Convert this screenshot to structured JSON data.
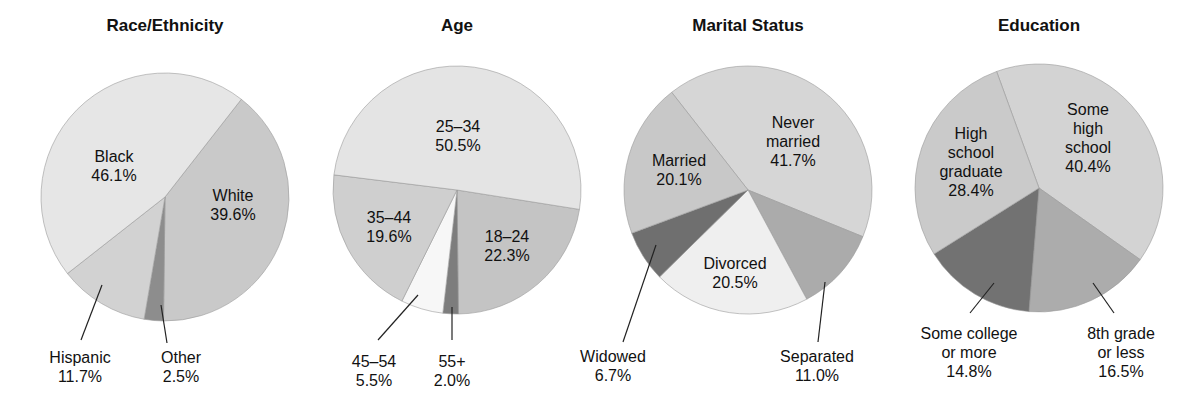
{
  "chart_data": [
    {
      "type": "pie",
      "title": "Race/Ethnicity",
      "center": [
        165,
        197
      ],
      "radius": 124,
      "start_angle": 38,
      "slices": [
        {
          "label": "White",
          "value": 39.6,
          "display": "39.6%",
          "color": "#c9c9c9",
          "label_pos": [
            233,
            186
          ],
          "inside": true
        },
        {
          "label": "Other",
          "value": 2.5,
          "display": "2.5%",
          "color": "#8d8d8d",
          "label_pos": [
            181,
            348
          ],
          "inside": false,
          "leader": [
            [
              161,
              305
            ],
            [
              167,
              343
            ]
          ]
        },
        {
          "label": "Hispanic",
          "value": 11.7,
          "display": "11.7%",
          "color": "#d2d2d2",
          "label_pos": [
            80,
            348
          ],
          "inside": false,
          "leader": [
            [
              102,
              285
            ],
            [
              81,
              340
            ]
          ]
        },
        {
          "label": "Black",
          "value": 46.1,
          "display": "46.1%",
          "color": "#e6e6e6",
          "label_pos": [
            114,
            147
          ],
          "inside": true
        }
      ]
    },
    {
      "type": "pie",
      "title": "Age",
      "center": [
        457,
        190
      ],
      "radius": 124,
      "start_angle": 99,
      "slices": [
        {
          "label": "18–24",
          "value": 22.3,
          "display": "22.3%",
          "color": "#c4c4c4",
          "label_pos": [
            507,
            227
          ],
          "inside": true
        },
        {
          "label": "55+",
          "value": 2.0,
          "display": "2.0%",
          "color": "#7d7d7d",
          "label_pos": [
            452,
            352
          ],
          "inside": false,
          "leader": [
            [
              452,
              307
            ],
            [
              452,
              340
            ]
          ]
        },
        {
          "label": "45–54",
          "value": 5.5,
          "display": "5.5%",
          "color": "#f7f7f7",
          "label_pos": [
            374,
            352
          ],
          "inside": false,
          "leader": [
            [
              418,
              295
            ],
            [
              378,
              340
            ]
          ]
        },
        {
          "label": "35–44",
          "value": 19.6,
          "display": "19.6%",
          "color": "#cfcfcf",
          "label_pos": [
            389,
            208
          ],
          "inside": true
        },
        {
          "label": "25–34",
          "value": 50.5,
          "display": "50.5%",
          "color": "#e4e4e4",
          "label_pos": [
            458,
            117
          ],
          "inside": true
        }
      ]
    },
    {
      "type": "pie",
      "title": "Marital Status",
      "center": [
        748,
        190
      ],
      "radius": 124,
      "start_angle": 322,
      "slices": [
        {
          "label": "Never married",
          "value": 41.7,
          "display": "41.7%",
          "color": "#d6d6d6",
          "label_pos": [
            793,
            113
          ],
          "lines": [
            "Never",
            "married",
            "41.7%"
          ],
          "inside": true
        },
        {
          "label": "Separated",
          "value": 11.0,
          "display": "11.0%",
          "color": "#ababab",
          "label_pos": [
            817,
            347
          ],
          "inside": false,
          "leader": [
            [
              825,
              282
            ],
            [
              818,
              342
            ]
          ]
        },
        {
          "label": "Divorced",
          "value": 20.5,
          "display": "20.5%",
          "color": "#efefef",
          "label_pos": [
            735,
            254
          ],
          "inside": true
        },
        {
          "label": "Widowed",
          "value": 6.7,
          "display": "6.7%",
          "color": "#6f6f6f",
          "label_pos": [
            613,
            347
          ],
          "inside": false,
          "leader": [
            [
              656,
              245
            ],
            [
              623,
              342
            ]
          ]
        },
        {
          "label": "Married",
          "value": 20.1,
          "display": "20.1%",
          "color": "#c8c8c8",
          "label_pos": [
            679,
            151
          ],
          "inside": true
        }
      ]
    },
    {
      "type": "pie",
      "title": "Education",
      "center": [
        1039,
        188
      ],
      "radius": 124,
      "start_angle": 340,
      "slices": [
        {
          "label": "Some high school",
          "value": 40.4,
          "display": "40.4%",
          "color": "#d3d3d3",
          "label_pos": [
            1088,
            100
          ],
          "lines": [
            "Some",
            "high",
            "school",
            "40.4%"
          ],
          "inside": true
        },
        {
          "label": "8th grade or less",
          "value": 16.5,
          "display": "16.5%",
          "color": "#acacac",
          "label_pos": [
            1121,
            324
          ],
          "lines": [
            "8th grade",
            "or less",
            "16.5%"
          ],
          "inside": false,
          "leader": [
            [
              1093,
              283
            ],
            [
              1114,
              313
            ]
          ]
        },
        {
          "label": "Some college or more",
          "value": 14.8,
          "display": "14.8%",
          "color": "#727272",
          "label_pos": [
            969,
            324
          ],
          "lines": [
            "Some college",
            "or more",
            "14.8%"
          ],
          "inside": false,
          "leader": [
            [
              994,
              283
            ],
            [
              970,
              313
            ]
          ]
        },
        {
          "label": "High school graduate",
          "value": 28.4,
          "display": "28.4%",
          "color": "#cacaca",
          "label_pos": [
            971,
            124
          ],
          "lines": [
            "High",
            "school",
            "graduate",
            "28.4%"
          ],
          "inside": true
        }
      ]
    }
  ],
  "titles": [
    "Race/Ethnicity",
    "Age",
    "Marital Status",
    "Education"
  ]
}
